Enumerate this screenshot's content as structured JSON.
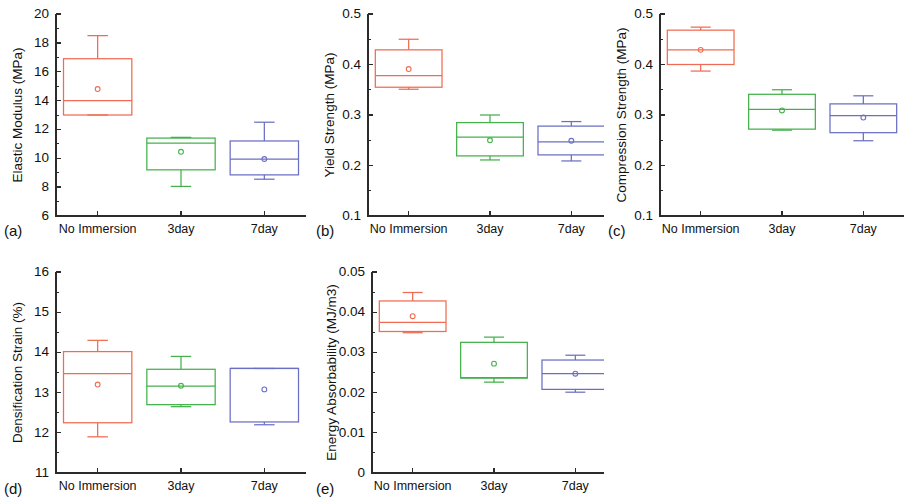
{
  "figure": {
    "background": "#ffffff",
    "width": 908,
    "height": 501,
    "series_colors": {
      "no_immersion": "#ef6c52",
      "3day": "#44b14b",
      "7day": "#6b6fc4"
    },
    "categories": [
      "No Immersion",
      "3day",
      "7day"
    ]
  },
  "panels": [
    {
      "tag": "(a)",
      "name": "elastic-modulus",
      "ylabel": "Elastic Modulus (MPa)",
      "ymin": 6,
      "ymax": 20,
      "ytick_step": 2,
      "yminor_per_major": 2,
      "ytick_labels": [
        "6",
        "8",
        "10",
        "12",
        "14",
        "16",
        "18",
        "20"
      ]
    },
    {
      "tag": "(b)",
      "name": "yield-strength",
      "ylabel": "Yield Strength (MPa)",
      "ymin": 0.1,
      "ymax": 0.5,
      "ytick_step": 0.1,
      "yminor_per_major": 2,
      "ytick_labels": [
        "0.1",
        "0.2",
        "0.3",
        "0.4",
        "0.5"
      ]
    },
    {
      "tag": "(c)",
      "name": "compression-strength",
      "ylabel": "Compression Strength (MPa)",
      "ymin": 0.1,
      "ymax": 0.5,
      "ytick_step": 0.1,
      "yminor_per_major": 2,
      "ytick_labels": [
        "0.1",
        "0.2",
        "0.3",
        "0.4",
        "0.5"
      ]
    },
    {
      "tag": "(d)",
      "name": "densification-strain",
      "ylabel": "Densification Strain (%)",
      "ymin": 11,
      "ymax": 16,
      "ytick_step": 1,
      "yminor_per_major": 2,
      "ytick_labels": [
        "11",
        "12",
        "13",
        "14",
        "15",
        "16"
      ]
    },
    {
      "tag": "(e)",
      "name": "energy-absorbability",
      "ylabel": "Energy Absorbability (MJ/m3)",
      "ymin": 0,
      "ymax": 0.05,
      "ytick_step": 0.01,
      "yminor_per_major": 2,
      "ytick_labels": [
        "0",
        "0.01",
        "0.02",
        "0.03",
        "0.04",
        "0.05"
      ]
    }
  ],
  "chart_data": [
    {
      "type": "box",
      "panel": "(a)",
      "title": "",
      "xlabel": "",
      "ylabel": "Elastic Modulus (MPa)",
      "ylim": [
        6,
        20
      ],
      "grid": false,
      "legend": "none",
      "categories": [
        "No Immersion",
        "3day",
        "7day"
      ],
      "boxes": [
        {
          "category": "No Immersion",
          "color": "#ef6c52",
          "whisker_low": 13.0,
          "q1": 13.0,
          "median": 14.0,
          "q3": 16.9,
          "whisker_high": 18.5,
          "mean": 14.8
        },
        {
          "category": "3day",
          "color": "#44b14b",
          "whisker_low": 8.05,
          "q1": 9.2,
          "median": 11.05,
          "q3": 11.4,
          "whisker_high": 11.45,
          "mean": 10.45
        },
        {
          "category": "7day",
          "color": "#6b6fc4",
          "whisker_low": 8.55,
          "q1": 8.85,
          "median": 9.95,
          "q3": 11.2,
          "whisker_high": 12.5,
          "mean": 9.95
        }
      ]
    },
    {
      "type": "box",
      "panel": "(b)",
      "title": "",
      "xlabel": "",
      "ylabel": "Yield Strength (MPa)",
      "ylim": [
        0.1,
        0.5
      ],
      "grid": false,
      "legend": "none",
      "categories": [
        "No Immersion",
        "3day",
        "7day"
      ],
      "boxes": [
        {
          "category": "No Immersion",
          "color": "#ef6c52",
          "whisker_low": 0.351,
          "q1": 0.355,
          "median": 0.378,
          "q3": 0.429,
          "whisker_high": 0.45,
          "mean": 0.391
        },
        {
          "category": "3day",
          "color": "#44b14b",
          "whisker_low": 0.211,
          "q1": 0.219,
          "median": 0.256,
          "q3": 0.285,
          "whisker_high": 0.3,
          "mean": 0.25
        },
        {
          "category": "7day",
          "color": "#6b6fc4",
          "whisker_low": 0.209,
          "q1": 0.221,
          "median": 0.247,
          "q3": 0.278,
          "whisker_high": 0.287,
          "mean": 0.249
        }
      ]
    },
    {
      "type": "box",
      "panel": "(c)",
      "title": "",
      "xlabel": "",
      "ylabel": "Compression Strength (MPa)",
      "ylim": [
        0.1,
        0.5
      ],
      "grid": false,
      "legend": "none",
      "categories": [
        "No Immersion",
        "3day",
        "7day"
      ],
      "boxes": [
        {
          "category": "No Immersion",
          "color": "#ef6c52",
          "whisker_low": 0.387,
          "q1": 0.4,
          "median": 0.429,
          "q3": 0.468,
          "whisker_high": 0.474,
          "mean": 0.429
        },
        {
          "category": "3day",
          "color": "#44b14b",
          "whisker_low": 0.27,
          "q1": 0.272,
          "median": 0.311,
          "q3": 0.341,
          "whisker_high": 0.35,
          "mean": 0.309
        },
        {
          "category": "7day",
          "color": "#6b6fc4",
          "whisker_low": 0.249,
          "q1": 0.265,
          "median": 0.299,
          "q3": 0.322,
          "whisker_high": 0.338,
          "mean": 0.295
        }
      ]
    },
    {
      "type": "box",
      "panel": "(d)",
      "title": "",
      "xlabel": "",
      "ylabel": "Densification Strain (%)",
      "ylim": [
        11,
        16
      ],
      "grid": false,
      "legend": "none",
      "categories": [
        "No Immersion",
        "3day",
        "7day"
      ],
      "boxes": [
        {
          "category": "No Immersion",
          "color": "#ef6c52",
          "whisker_low": 11.9,
          "q1": 12.25,
          "median": 13.47,
          "q3": 14.02,
          "whisker_high": 14.3,
          "mean": 13.2
        },
        {
          "category": "3day",
          "color": "#44b14b",
          "whisker_low": 12.65,
          "q1": 12.7,
          "median": 13.16,
          "q3": 13.58,
          "whisker_high": 13.9,
          "mean": 13.17
        },
        {
          "category": "7day",
          "color": "#6b6fc4",
          "whisker_low": 12.2,
          "q1": 12.27,
          "median": 13.6,
          "q3": 13.6,
          "whisker_high": 13.6,
          "mean": 13.08
        }
      ]
    },
    {
      "type": "box",
      "panel": "(e)",
      "title": "",
      "xlabel": "",
      "ylabel": "Energy Absorbability (MJ/m3)",
      "ylim": [
        0,
        0.05
      ],
      "grid": false,
      "legend": "none",
      "categories": [
        "No Immersion",
        "3day",
        "7day"
      ],
      "boxes": [
        {
          "category": "No Immersion",
          "color": "#ef6c52",
          "whisker_low": 0.0349,
          "q1": 0.0352,
          "median": 0.0375,
          "q3": 0.0428,
          "whisker_high": 0.0449,
          "mean": 0.039
        },
        {
          "category": "3day",
          "color": "#44b14b",
          "whisker_low": 0.0226,
          "q1": 0.0236,
          "median": 0.0237,
          "q3": 0.0325,
          "whisker_high": 0.0338,
          "mean": 0.0272
        },
        {
          "category": "7day",
          "color": "#6b6fc4",
          "whisker_low": 0.0201,
          "q1": 0.0208,
          "median": 0.0247,
          "q3": 0.0281,
          "whisker_high": 0.0293,
          "mean": 0.0247
        }
      ]
    }
  ]
}
